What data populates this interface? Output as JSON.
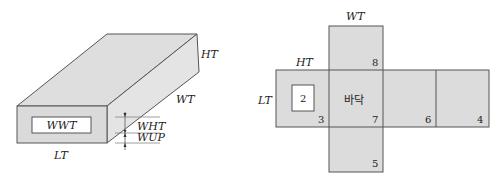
{
  "box3d": {
    "labels": {
      "height": "HT",
      "width": "WT",
      "length": "LT",
      "window": "WWT",
      "window_height": "WHT",
      "window_up": "WUP"
    }
  },
  "net": {
    "labels": {
      "top": "WT",
      "height": "HT",
      "length": "LT",
      "bottom": "바닥"
    },
    "numbers": {
      "window": "2",
      "n3": "3",
      "n4": "4",
      "n5": "5",
      "n6": "6",
      "n7": "7",
      "n8": "8"
    }
  },
  "colors": {
    "face_fill": "#dcdcdc",
    "stroke": "#555555",
    "window_fill": "#ffffff"
  }
}
